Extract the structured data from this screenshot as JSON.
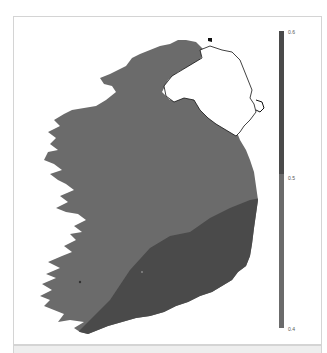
{
  "map": {
    "region": "Ireland",
    "excluded_region": "Northern Ireland (outline only)",
    "colors": {
      "low_band": "#6b6b6b",
      "high_band": "#4a4a4a",
      "outline": "#111111",
      "background": "#ffffff"
    }
  },
  "colorbar": {
    "min": 0.4,
    "max": 0.6,
    "ticks": [
      {
        "value": 0.6,
        "label": "0.6"
      },
      {
        "value": 0.5,
        "label": "0.5"
      },
      {
        "value": 0.4,
        "label": "0.4"
      }
    ],
    "segments": [
      {
        "from": 0.5,
        "to": 0.6,
        "color": "#4a4a4a"
      },
      {
        "from": 0.4,
        "to": 0.5,
        "color": "#6b6b6b"
      }
    ]
  }
}
